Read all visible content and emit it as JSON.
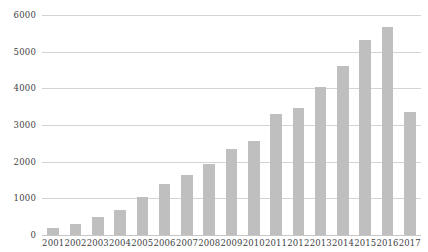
{
  "chart_data": {
    "type": "bar",
    "title": "",
    "subtitle": "",
    "xlabel": "",
    "ylabel": "",
    "categories": [
      "2001",
      "2002",
      "2003",
      "2004",
      "2005",
      "2006",
      "2007",
      "2008",
      "2009",
      "2010",
      "2011",
      "2012",
      "2013",
      "2014",
      "2015",
      "2016",
      "2017"
    ],
    "values": [
      190,
      290,
      500,
      680,
      1040,
      1380,
      1630,
      1950,
      2340,
      2560,
      3300,
      3460,
      4050,
      4620,
      5330,
      5660,
      3350
    ],
    "series": [
      {
        "name": "",
        "values": [
          190,
          290,
          500,
          680,
          1040,
          1380,
          1630,
          1950,
          2340,
          2560,
          3300,
          3460,
          4050,
          4620,
          5330,
          5660,
          3350
        ]
      }
    ],
    "ylim": [
      0,
      6000
    ],
    "y_ticks": [
      0,
      1000,
      2000,
      3000,
      4000,
      5000,
      6000
    ],
    "y_tick_labels": [
      "0",
      "1000",
      "2000",
      "3000",
      "4000",
      "5000",
      "6000"
    ],
    "grid": true,
    "grid_axis": "y",
    "legend": false,
    "legend_position": "none",
    "bar_color": "#bfbfbf",
    "gridline_color": "#d3d3d3",
    "text_color": "#3f3f3f",
    "background_color": "#ffffff",
    "annotations": []
  }
}
